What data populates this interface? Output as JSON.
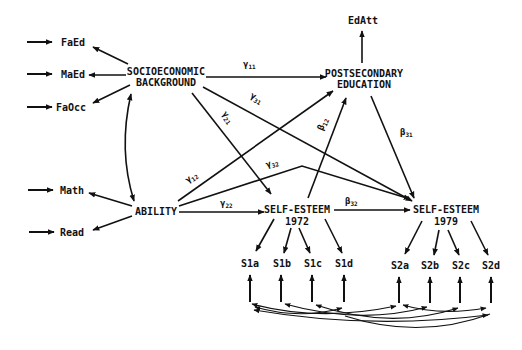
{
  "diagram": {
    "type": "structural equation path diagram",
    "latent_nodes": {
      "ses": {
        "line1": "SOCIOECONOMIC",
        "line2": "BACKGROUND"
      },
      "postsec": {
        "line1": "POSTSECONDARY",
        "line2": "EDUCATION"
      },
      "ability": {
        "label": "ABILITY"
      },
      "se72": {
        "line1": "SELF-ESTEEM",
        "line2": "1972"
      },
      "se79": {
        "line1": "SELF-ESTEEM",
        "line2": "1979"
      }
    },
    "indicators": {
      "faed": "FaEd",
      "maed": "MaEd",
      "faocc": "FaOcc",
      "math": "Math",
      "read": "Read",
      "edatt": "EdAtt",
      "s1a": "S1a",
      "s1b": "S1b",
      "s1c": "S1c",
      "s1d": "S1d",
      "s2a": "S2a",
      "s2b": "S2b",
      "s2c": "S2c",
      "s2d": "S2d"
    },
    "coefficients": {
      "g11": {
        "sym": "γ",
        "sub": "11"
      },
      "g31": {
        "sym": "γ",
        "sub": "31"
      },
      "g21": {
        "sym": "γ",
        "sub": "21"
      },
      "g12": {
        "sym": "γ",
        "sub": "12"
      },
      "g32": {
        "sym": "γ",
        "sub": "32"
      },
      "g22": {
        "sym": "γ",
        "sub": "22"
      },
      "b12": {
        "sym": "β",
        "sub": "12"
      },
      "b31": {
        "sym": "β",
        "sub": "31"
      },
      "b32": {
        "sym": "β",
        "sub": "32"
      }
    },
    "paths": [
      {
        "from": "SOCIOECONOMIC BACKGROUND",
        "to": "POSTSECONDARY EDUCATION",
        "label": "γ11"
      },
      {
        "from": "SOCIOECONOMIC BACKGROUND",
        "to": "SELF-ESTEEM 1979",
        "label": "γ31"
      },
      {
        "from": "SOCIOECONOMIC BACKGROUND",
        "to": "SELF-ESTEEM 1972",
        "label": "γ21"
      },
      {
        "from": "ABILITY",
        "to": "POSTSECONDARY EDUCATION",
        "label": "γ12"
      },
      {
        "from": "ABILITY",
        "to": "SELF-ESTEEM 1979",
        "label": "γ32"
      },
      {
        "from": "ABILITY",
        "to": "SELF-ESTEEM 1972",
        "label": "γ22"
      },
      {
        "from": "SELF-ESTEEM 1972",
        "to": "POSTSECONDARY EDUCATION",
        "label": "β12"
      },
      {
        "from": "POSTSECONDARY EDUCATION",
        "to": "SELF-ESTEEM 1979",
        "label": "β31"
      },
      {
        "from": "SELF-ESTEEM 1972",
        "to": "SELF-ESTEEM 1979",
        "label": "β32"
      },
      {
        "from": "SOCIOECONOMIC BACKGROUND",
        "to": "ABILITY",
        "label": "",
        "kind": "correlation"
      }
    ]
  }
}
